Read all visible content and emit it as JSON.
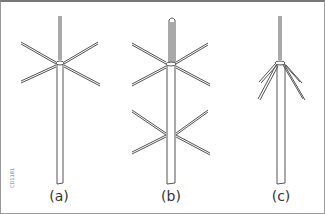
{
  "figure": {
    "code": "CD1181",
    "labels": [
      "(a)",
      "(b)",
      "(c)"
    ],
    "panels": [
      {
        "label": "(a)",
        "description": "vertical mast with six horizontal radial elements at top"
      },
      {
        "label": "(b)",
        "description": "folded vertical element with two tiers of six radial elements"
      },
      {
        "label": "(c)",
        "description": "vertical whip with drooping ground-plane radials"
      }
    ]
  }
}
